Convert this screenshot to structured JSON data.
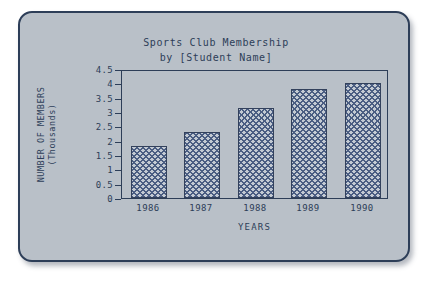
{
  "card": {
    "background_color": "#b9c0c8",
    "border_color": "#2d3e58"
  },
  "chart_data": {
    "type": "bar",
    "title": "Sports Club Membership",
    "subtitle": "by [Student Name]",
    "title_lines": [
      "Sports Club Membership",
      "by [Student Name]"
    ],
    "categories": [
      "1986",
      "1987",
      "1988",
      "1989",
      "1990"
    ],
    "values": [
      1.8,
      2.3,
      3.15,
      3.8,
      4.0
    ],
    "xlabel": "YEARS",
    "ylabel": "NUMBER OF MEMBERS",
    "ylabel_line2": "(Thousands)",
    "ylim": [
      0,
      4.5
    ],
    "ytick_labels": [
      "0",
      "0.5",
      "1",
      "1.5",
      "2",
      "2.5",
      "3",
      "3.5",
      "4",
      "4.5"
    ],
    "ytick_values": [
      0,
      0.5,
      1,
      1.5,
      2,
      2.5,
      3,
      3.5,
      4,
      4.5
    ],
    "grid": false,
    "legend": false,
    "bar_fill_color": "#4a5d82",
    "bar_edge_color": "#33415c",
    "axis_color": "#2d3e58"
  }
}
